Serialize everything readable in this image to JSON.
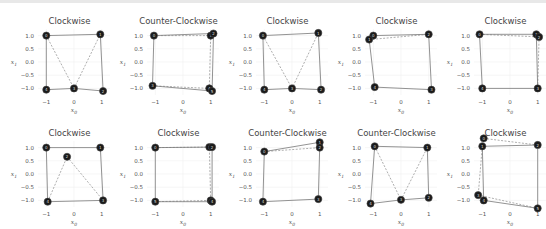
{
  "chart_data": [
    {
      "type": "scatter",
      "title": "Clockwise",
      "xlabel": "x0",
      "ylabel": "x1",
      "xticks": [
        "-1",
        "0",
        "1"
      ],
      "yticks": [
        "1.0",
        "0.5",
        "0.0",
        "-0.5",
        "-1.0"
      ],
      "xlim": [
        -1.3,
        1.3
      ],
      "ylim": [
        -1.25,
        1.25
      ],
      "points": [
        [
          -1,
          1
        ],
        [
          0.95,
          1.05
        ],
        [
          1.05,
          -1.1
        ],
        [
          0,
          -1
        ],
        [
          -1,
          -1.05
        ]
      ],
      "solid_path": [
        [
          -1,
          1
        ],
        [
          0.95,
          1.05
        ],
        [
          1.05,
          -1.1
        ],
        [
          0,
          -1
        ],
        [
          -1,
          -1.05
        ],
        [
          -1,
          1
        ]
      ],
      "dashed_path": [
        [
          -1,
          1
        ],
        [
          0,
          -1
        ],
        [
          0.95,
          1.05
        ]
      ]
    },
    {
      "type": "scatter",
      "title": "Counter-Clockwise",
      "xlabel": "x0",
      "ylabel": "x1",
      "xticks": [
        "-1",
        "0",
        "1"
      ],
      "yticks": [
        "1.0",
        "0.5",
        "0.0",
        "-0.5",
        "-1.0"
      ],
      "xlim": [
        -1.3,
        1.3
      ],
      "ylim": [
        -1.25,
        1.25
      ],
      "points": [
        [
          -1.05,
          1.0
        ],
        [
          1.0,
          1.0
        ],
        [
          1.1,
          1.08
        ],
        [
          -1.1,
          -0.9
        ],
        [
          0.95,
          -1.0
        ],
        [
          1.05,
          -1.1
        ]
      ],
      "solid_path": [
        [
          -1.05,
          1.0
        ],
        [
          1.1,
          1.08
        ],
        [
          1.05,
          -1.1
        ],
        [
          -1.1,
          -0.9
        ],
        [
          -1.05,
          1.0
        ]
      ],
      "dashed_path": [
        [
          -1.05,
          1.0
        ],
        [
          1.0,
          1.0
        ],
        [
          0.95,
          -1.0
        ],
        [
          -1.1,
          -0.9
        ]
      ]
    },
    {
      "type": "scatter",
      "title": "Clockwise",
      "xlabel": "x0",
      "ylabel": "x1",
      "xticks": [
        "-1",
        "0",
        "1"
      ],
      "yticks": [
        "1.0",
        "0.5",
        "0.0",
        "-0.5",
        "-1.0"
      ],
      "xlim": [
        -1.3,
        1.3
      ],
      "ylim": [
        -1.25,
        1.25
      ],
      "points": [
        [
          -1.05,
          1.0
        ],
        [
          0.95,
          1.1
        ],
        [
          1.05,
          -1.05
        ],
        [
          0,
          -1.0
        ],
        [
          -1.0,
          -1.05
        ]
      ],
      "solid_path": [
        [
          -1.05,
          1.0
        ],
        [
          0.95,
          1.1
        ],
        [
          1.05,
          -1.05
        ],
        [
          0,
          -1.0
        ],
        [
          -1.0,
          -1.05
        ],
        [
          -1.05,
          1.0
        ]
      ],
      "dashed_path": [
        [
          -1.05,
          1.0
        ],
        [
          0,
          -1.0
        ],
        [
          0.95,
          1.1
        ]
      ]
    },
    {
      "type": "scatter",
      "title": "Clockwise",
      "xlabel": "x0",
      "ylabel": "x1",
      "xticks": [
        "-1",
        "0",
        "1"
      ],
      "yticks": [
        "1.0",
        "0.5",
        "0.0",
        "-0.5",
        "-1.0"
      ],
      "xlim": [
        -1.3,
        1.3
      ],
      "ylim": [
        -1.25,
        1.25
      ],
      "points": [
        [
          -1.0,
          1.0
        ],
        [
          -1.15,
          0.85
        ],
        [
          1.0,
          1.05
        ],
        [
          1.1,
          -1.05
        ],
        [
          -0.95,
          -0.95
        ]
      ],
      "solid_path": [
        [
          -1.0,
          1.0
        ],
        [
          1.0,
          1.05
        ],
        [
          1.1,
          -1.05
        ],
        [
          -0.95,
          -0.95
        ],
        [
          -1.15,
          0.85
        ]
      ],
      "dashed_path": [
        [
          -1.15,
          0.85
        ],
        [
          1.0,
          1.05
        ]
      ]
    },
    {
      "type": "scatter",
      "title": "Clockwise",
      "xlabel": "x0",
      "ylabel": "x1",
      "xticks": [
        "-1",
        "0",
        "1"
      ],
      "yticks": [
        "1.0",
        "0.5",
        "0.0",
        "-0.5",
        "-1.0"
      ],
      "xlim": [
        -1.3,
        1.3
      ],
      "ylim": [
        -1.25,
        1.25
      ],
      "points": [
        [
          -1.1,
          1.05
        ],
        [
          0.95,
          1.05
        ],
        [
          1.05,
          0.95
        ],
        [
          1.0,
          -1.0
        ],
        [
          -1.0,
          -1.0
        ]
      ],
      "solid_path": [
        [
          -1.1,
          1.05
        ],
        [
          0.95,
          1.05
        ],
        [
          1.0,
          -1.0
        ],
        [
          -1.0,
          -1.0
        ],
        [
          -1.1,
          1.05
        ]
      ],
      "dashed_path": [
        [
          -1.1,
          1.05
        ],
        [
          1.05,
          0.95
        ],
        [
          1.0,
          -1.0
        ]
      ]
    },
    {
      "type": "scatter",
      "title": "Clockwise",
      "xlabel": "x0",
      "ylabel": "x1",
      "xticks": [
        "-1",
        "0",
        "1"
      ],
      "yticks": [
        "1.0",
        "0.5",
        "0.0",
        "-0.5",
        "-1.0"
      ],
      "xlim": [
        -1.3,
        1.3
      ],
      "ylim": [
        -1.25,
        1.25
      ],
      "points": [
        [
          -1.0,
          1.0
        ],
        [
          0.95,
          1.0
        ],
        [
          -0.25,
          0.65
        ],
        [
          1.05,
          -1.0
        ],
        [
          -0.95,
          -1.05
        ]
      ],
      "solid_path": [
        [
          -1.0,
          1.0
        ],
        [
          0.95,
          1.0
        ],
        [
          1.05,
          -1.0
        ],
        [
          -0.95,
          -1.05
        ],
        [
          -1.0,
          1.0
        ]
      ],
      "dashed_path": [
        [
          -0.95,
          -1.05
        ],
        [
          -0.25,
          0.65
        ],
        [
          1.05,
          -1.0
        ]
      ]
    },
    {
      "type": "scatter",
      "title": "Clockwise",
      "xlabel": "x0",
      "ylabel": "x1",
      "xticks": [
        "-1",
        "0",
        "1"
      ],
      "yticks": [
        "1.0",
        "0.5",
        "0.0",
        "-0.5",
        "-1.0"
      ],
      "xlim": [
        -1.3,
        1.3
      ],
      "ylim": [
        -1.25,
        1.25
      ],
      "points": [
        [
          -1.0,
          1.0
        ],
        [
          0.95,
          1.02
        ],
        [
          1.05,
          1.02
        ],
        [
          1.0,
          -1.0
        ],
        [
          1.05,
          -1.05
        ],
        [
          -1.0,
          -1.05
        ]
      ],
      "solid_path": [
        [
          -1.0,
          1.0
        ],
        [
          1.05,
          1.02
        ],
        [
          1.05,
          -1.05
        ],
        [
          -1.0,
          -1.05
        ],
        [
          -1.0,
          1.0
        ]
      ],
      "dashed_path": [
        [
          -1.0,
          1.0
        ],
        [
          0.95,
          1.02
        ],
        [
          1.0,
          -1.0
        ],
        [
          -1.0,
          -1.05
        ]
      ]
    },
    {
      "type": "scatter",
      "title": "Counter-Clockwise",
      "xlabel": "x0",
      "ylabel": "x1",
      "xticks": [
        "-1",
        "0",
        "1"
      ],
      "yticks": [
        "1.0",
        "0.5",
        "0.0",
        "-0.5",
        "-1.0"
      ],
      "xlim": [
        -1.3,
        1.3
      ],
      "ylim": [
        -1.25,
        1.25
      ],
      "points": [
        [
          -1.0,
          0.85
        ],
        [
          1.0,
          1.2
        ],
        [
          1.0,
          1.0
        ],
        [
          0.95,
          -0.95
        ],
        [
          -1.05,
          -1.05
        ]
      ],
      "solid_path": [
        [
          -1.0,
          0.85
        ],
        [
          1.0,
          1.2
        ],
        [
          1.0,
          1.0
        ],
        [
          0.95,
          -0.95
        ],
        [
          -1.05,
          -1.05
        ],
        [
          -1.0,
          0.85
        ]
      ],
      "dashed_path": [
        [
          -1.0,
          0.85
        ],
        [
          1.0,
          1.0
        ]
      ]
    },
    {
      "type": "scatter",
      "title": "Counter-Clockwise",
      "xlabel": "x0",
      "ylabel": "x1",
      "xticks": [
        "-1",
        "0",
        "1"
      ],
      "yticks": [
        "1.0",
        "0.5",
        "0.0",
        "-0.5",
        "-1.0"
      ],
      "xlim": [
        -1.3,
        1.3
      ],
      "ylim": [
        -1.25,
        1.25
      ],
      "points": [
        [
          -0.95,
          1.05
        ],
        [
          0.95,
          1.0
        ],
        [
          1.0,
          -0.9
        ],
        [
          0,
          -0.98
        ],
        [
          -1.1,
          -1.12
        ]
      ],
      "solid_path": [
        [
          -0.95,
          1.05
        ],
        [
          0.95,
          1.0
        ],
        [
          1.0,
          -0.9
        ],
        [
          0,
          -0.98
        ],
        [
          -1.1,
          -1.12
        ],
        [
          -0.95,
          1.05
        ]
      ],
      "dashed_path": [
        [
          -0.95,
          1.05
        ],
        [
          0,
          -0.98
        ],
        [
          0.95,
          1.0
        ]
      ]
    },
    {
      "type": "scatter",
      "title": "Clockwise",
      "xlabel": "x0",
      "ylabel": "x1",
      "xticks": [
        "-1",
        "0",
        "1"
      ],
      "yticks": [
        "1.0",
        "0.5",
        "0.0",
        "-0.5",
        "-1.0"
      ],
      "xlim": [
        -1.3,
        1.3
      ],
      "ylim": [
        -1.25,
        1.25
      ],
      "points": [
        [
          -0.95,
          1.35
        ],
        [
          -1.0,
          1.05
        ],
        [
          1.0,
          1.1
        ],
        [
          -1.15,
          -0.8
        ],
        [
          -0.95,
          -1.0
        ],
        [
          1.0,
          -1.3
        ]
      ],
      "solid_path": [
        [
          -1.0,
          1.05
        ],
        [
          1.0,
          1.1
        ],
        [
          1.0,
          -1.3
        ],
        [
          -0.95,
          -1.0
        ],
        [
          -1.0,
          1.05
        ]
      ],
      "dashed_path": [
        [
          -0.95,
          1.35
        ],
        [
          1.0,
          1.1
        ]
      ],
      "dashed_path_2": [
        [
          -1.0,
          1.05
        ],
        [
          -1.15,
          -0.8
        ],
        [
          1.0,
          -1.3
        ]
      ]
    }
  ]
}
